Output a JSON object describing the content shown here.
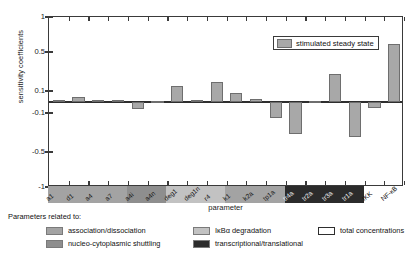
{
  "chart_data": {
    "type": "bar",
    "title": "",
    "xlabel": "parameter",
    "ylabel": "sensitivity coefficients",
    "ytick_labels": [
      "1",
      "0.5",
      "0.1",
      "-0.1",
      "-0.5",
      "-1"
    ],
    "ytick_values": [
      1,
      0.5,
      0.1,
      -0.1,
      -0.5,
      -1
    ],
    "ylim": [
      -1,
      1
    ],
    "axis_scale": "piecewise-symlog",
    "grid": false,
    "legend_position": "upper right inside",
    "series": [
      {
        "name": "stimulated steady state",
        "color": "#a8a8a8",
        "values": [
          0.02,
          0.05,
          0.02,
          0.015,
          -0.06,
          0.005,
          0.15,
          0.015,
          0.19,
          0.085,
          0.025,
          -0.15,
          -0.32,
          0.005,
          0.27,
          -0.35,
          -0.05,
          0.62
        ]
      }
    ],
    "categories": [
      "a1",
      "d1",
      "a4",
      "a7",
      "a4i",
      "a4n",
      "deg1",
      "deg1n",
      "r4",
      "k1",
      "k2a",
      "tp1a",
      "tr4a",
      "tr2a",
      "tr3a",
      "tr1a",
      "IKK",
      "NF-κB"
    ],
    "category_groups": [
      "association/dissociation",
      "association/dissociation",
      "association/dissociation",
      "association/dissociation",
      "nucleo-cytoplasmic shuttling",
      "nucleo-cytoplasmic shuttling",
      "IκBα degradation",
      "IκBα degradation",
      "IκBα degradation",
      "association/dissociation",
      "association/dissociation",
      "association/dissociation",
      "transcriptional/translational",
      "transcriptional/translational",
      "transcriptional/translational",
      "transcriptional/translational",
      "total concentrations",
      "total concentrations"
    ]
  },
  "plot_legend": {
    "swatch_label": "stimulated steady state"
  },
  "bottom_legend": {
    "header": "Parameters related to:",
    "entries": [
      {
        "label": "association/dissociation",
        "color": "#a3a3a3"
      },
      {
        "label": "nucleo-cytoplasmic shuttling",
        "color": "#8e8e8e"
      },
      {
        "label": "IκBα degradation",
        "color": "#c2c2c2"
      },
      {
        "label": "transcriptional/translational",
        "color": "#2b2b2b"
      },
      {
        "label": "total concentrations",
        "color": "#ffffff"
      }
    ]
  },
  "group_colors": {
    "association/dissociation": "#a3a3a3",
    "nucleo-cytoplasmic shuttling": "#8e8e8e",
    "IκBα degradation": "#c2c2c2",
    "transcriptional/translational": "#2b2b2b",
    "total concentrations": "#ffffff"
  }
}
